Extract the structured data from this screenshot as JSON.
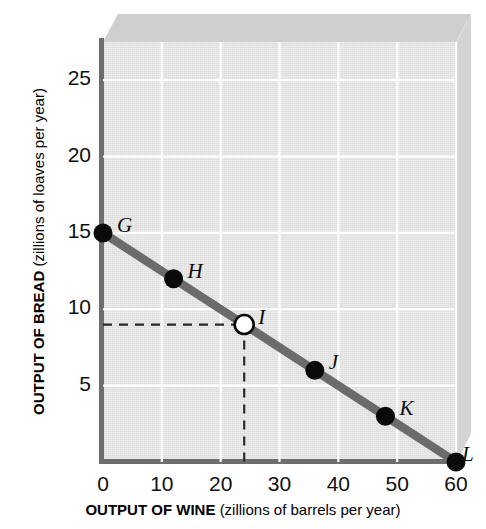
{
  "chart_data": {
    "type": "line",
    "title": "",
    "subtitle": "",
    "xlabel_bold": "OUTPUT OF WINE",
    "xlabel_rest": "(zillions of barrels per year)",
    "ylabel_bold": "OUTPUT OF BREAD",
    "ylabel_rest": "(zillions of loaves per year)",
    "xlim": [
      0,
      60
    ],
    "ylim": [
      0,
      27.5
    ],
    "xticks": [
      0,
      10,
      20,
      30,
      40,
      50,
      60
    ],
    "xtick_labels": [
      "0",
      "10",
      "20",
      "30",
      "40",
      "50",
      "60"
    ],
    "yticks": [
      5,
      10,
      15,
      20,
      25
    ],
    "ytick_labels": [
      "5",
      "10",
      "15",
      "20",
      "25"
    ],
    "grid": true,
    "grid_color": "#ffffff",
    "plot_bg": "#e4e4e4",
    "legend": null,
    "series": [
      {
        "name": "Production Possibilities Frontier",
        "color": "#6b6b6b",
        "x": [
          0,
          12,
          24,
          36,
          48,
          60
        ],
        "values": [
          15,
          12,
          9,
          6,
          3,
          0
        ]
      }
    ],
    "points": [
      {
        "label": "G",
        "x": 0,
        "y": 15,
        "marker": "filled",
        "label_dx": 14,
        "label_dy": -20
      },
      {
        "label": "H",
        "x": 12,
        "y": 12,
        "marker": "filled",
        "label_dx": 14,
        "label_dy": -20
      },
      {
        "label": "I",
        "x": 24,
        "y": 9,
        "marker": "open",
        "label_dx": 14,
        "label_dy": -20
      },
      {
        "label": "J",
        "x": 36,
        "y": 6,
        "marker": "filled",
        "label_dx": 14,
        "label_dy": -20
      },
      {
        "label": "K",
        "x": 48,
        "y": 3,
        "marker": "filled",
        "label_dx": 14,
        "label_dy": -20
      },
      {
        "label": "L",
        "x": 60,
        "y": 0,
        "marker": "filled",
        "label_dx": 6,
        "label_dy": -20
      }
    ],
    "annotations": [
      {
        "name": "guide-lines-point-I",
        "style": "dashed",
        "color": "#2a2a2a",
        "from_x": 0,
        "to_x": 24,
        "from_y": 9,
        "to_y": 0,
        "describes": "dashed guide from y-axis at 9 across to point I, then down to x-axis at 24"
      }
    ],
    "point_marker_colors": {
      "filled": "#0a0a0a",
      "open_fill": "#ffffff",
      "open_stroke": "#0a0a0a"
    },
    "axis_color": "#6e6e6e",
    "slab_top_color": "#cfcfcf",
    "slab_right_color": "#d4d4d4"
  }
}
